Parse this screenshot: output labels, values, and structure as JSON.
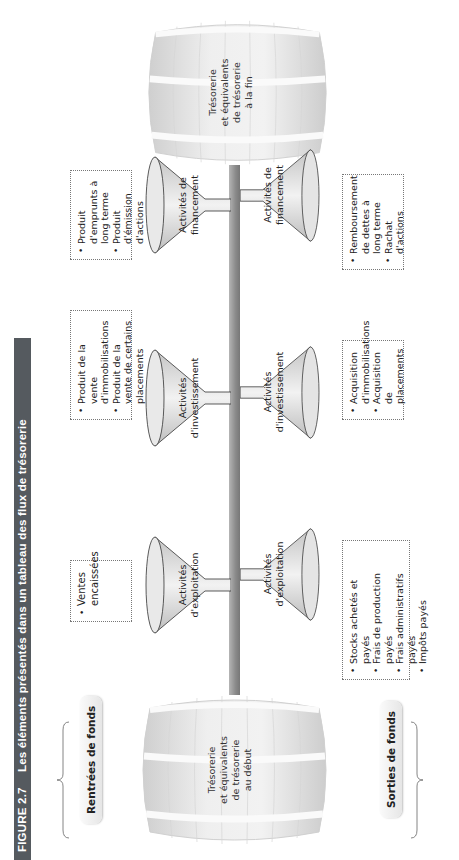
{
  "figure": {
    "number": "FIGURE 2.7",
    "title": "Les éléments présentés dans un tableau des flux de trésorerie"
  },
  "sections": {
    "inflows_label": "Rentrées de fonds",
    "outflows_label": "Sorties de fonds"
  },
  "barrels": {
    "start": {
      "lines": [
        "Trésorerie",
        "et équivalents",
        "de trésorerie",
        "au début"
      ]
    },
    "end": {
      "lines": [
        "Trésorerie",
        "et équivalents",
        "de trésorerie",
        "à la fin"
      ]
    }
  },
  "inflows": [
    {
      "funnel_lines": [
        "Activités",
        "d'exploitation"
      ],
      "items": [
        "Ventes encaissées"
      ]
    },
    {
      "funnel_lines": [
        "Activités",
        "d'investissement"
      ],
      "items": [
        "Produit de la vente d'immobilisations",
        "Produit de la vente de certains placements"
      ]
    },
    {
      "funnel_lines": [
        "Activités de",
        "financement"
      ],
      "items": [
        "Produit d'emprunts à long terme",
        "Produit d'émission d'actions"
      ]
    }
  ],
  "outflows": [
    {
      "funnel_lines": [
        "Activités",
        "d'exploitation"
      ],
      "items": [
        "Stocks achetés et payés",
        "Frais de production payés",
        "Frais administratifs payés",
        "Impôts payés"
      ]
    },
    {
      "funnel_lines": [
        "Activités",
        "d'investissement"
      ],
      "items": [
        "Acquisition d'immobilisations",
        "Acquisition de placements"
      ]
    },
    {
      "funnel_lines": [
        "Activités de",
        "financement"
      ],
      "items": [
        "Remboursement de dettes à long terme",
        "Rachat d'actions"
      ]
    }
  ],
  "colors": {
    "title_bar": "#555a5f",
    "shaft": "#8a8a8a",
    "barrel": "#e3e3e3",
    "funnel": "#dcdcdc"
  }
}
